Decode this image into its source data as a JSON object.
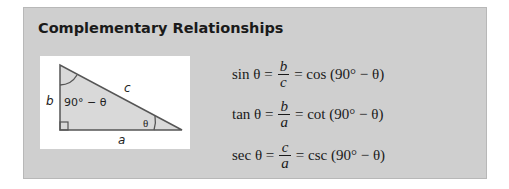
{
  "box": {
    "title": "Complementary Relationships",
    "background": "#cfcfcf"
  },
  "figure": {
    "labels": {
      "hypotenuse": "c",
      "vertical_side": "b",
      "horizontal_side": "a",
      "top_angle": "90° − θ",
      "bottom_angle": "θ"
    },
    "triangle_fill": "#d6d6d6",
    "stroke": "#555555"
  },
  "equations": [
    {
      "lhs": "sin θ =",
      "num": "b",
      "den": "c",
      "rhs": "= cos (90° − θ)"
    },
    {
      "lhs": "tan θ =",
      "num": "b",
      "den": "a",
      "rhs": "= cot (90° − θ)"
    },
    {
      "lhs": "sec θ =",
      "num": "c",
      "den": "a",
      "rhs": "= csc (90° − θ)"
    }
  ]
}
